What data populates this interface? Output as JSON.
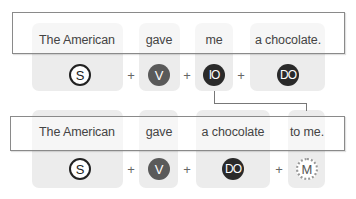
{
  "diagram": {
    "sentence1": {
      "words": [
        "The American",
        "gave",
        "me",
        "a chocolate."
      ],
      "roles": [
        {
          "label": "S",
          "style": "outline"
        },
        {
          "label": "V",
          "style": "gray"
        },
        {
          "label": "IO",
          "style": "dark"
        },
        {
          "label": "DO",
          "style": "dark"
        }
      ],
      "operator": "+"
    },
    "sentence2": {
      "words": [
        "The American",
        "gave",
        "a chocolate",
        "to me."
      ],
      "roles": [
        {
          "label": "S",
          "style": "outline"
        },
        {
          "label": "V",
          "style": "gray"
        },
        {
          "label": "DO",
          "style": "dark"
        },
        {
          "label": "M",
          "style": "dotted"
        }
      ],
      "operator": "+"
    },
    "connector": {
      "from": "IO",
      "to": "M"
    },
    "colors": {
      "column_bg": "#ececec",
      "dark_circle": "#2a2a2a",
      "gray_circle": "#5a5a5a",
      "bar_border": "#8a8a8a"
    }
  }
}
